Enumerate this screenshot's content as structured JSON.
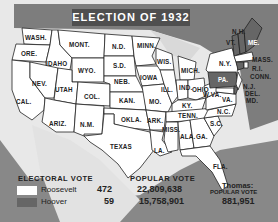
{
  "title": "ELECTION OF 1932",
  "colors": {
    "roosevelt": "#ffffff",
    "hoover": "#666666",
    "water": "#7d7d7d",
    "background": "#e8e8e8"
  },
  "states": [
    {
      "abbr": "WASH.",
      "winner": "Roosevelt"
    },
    {
      "abbr": "ORE.",
      "winner": "Roosevelt"
    },
    {
      "abbr": "CAL.",
      "winner": "Roosevelt"
    },
    {
      "abbr": "IDAHO",
      "winner": "Roosevelt"
    },
    {
      "abbr": "NEV.",
      "winner": "Roosevelt"
    },
    {
      "abbr": "MONT.",
      "winner": "Roosevelt"
    },
    {
      "abbr": "WYO.",
      "winner": "Roosevelt"
    },
    {
      "abbr": "UTAH",
      "winner": "Roosevelt"
    },
    {
      "abbr": "COL.",
      "winner": "Roosevelt"
    },
    {
      "abbr": "ARIZ.",
      "winner": "Roosevelt"
    },
    {
      "abbr": "N.M.",
      "winner": "Roosevelt"
    },
    {
      "abbr": "N.D.",
      "winner": "Roosevelt"
    },
    {
      "abbr": "S.D.",
      "winner": "Roosevelt"
    },
    {
      "abbr": "NEB.",
      "winner": "Roosevelt"
    },
    {
      "abbr": "KAN.",
      "winner": "Roosevelt"
    },
    {
      "abbr": "OKLA.",
      "winner": "Roosevelt"
    },
    {
      "abbr": "TEXAS",
      "winner": "Roosevelt"
    },
    {
      "abbr": "MINN.",
      "winner": "Roosevelt"
    },
    {
      "abbr": "IOWA",
      "winner": "Roosevelt"
    },
    {
      "abbr": "MO.",
      "winner": "Roosevelt"
    },
    {
      "abbr": "ARK.",
      "winner": "Roosevelt"
    },
    {
      "abbr": "LA.",
      "winner": "Roosevelt"
    },
    {
      "abbr": "WIS.",
      "winner": "Roosevelt"
    },
    {
      "abbr": "ILL.",
      "winner": "Roosevelt"
    },
    {
      "abbr": "MICH.",
      "winner": "Roosevelt"
    },
    {
      "abbr": "IND.",
      "winner": "Roosevelt"
    },
    {
      "abbr": "OHIO",
      "winner": "Roosevelt"
    },
    {
      "abbr": "KY.",
      "winner": "Roosevelt"
    },
    {
      "abbr": "TENN.",
      "winner": "Roosevelt"
    },
    {
      "abbr": "MISS.",
      "winner": "Roosevelt"
    },
    {
      "abbr": "ALA.",
      "winner": "Roosevelt"
    },
    {
      "abbr": "GA.",
      "winner": "Roosevelt"
    },
    {
      "abbr": "FLA.",
      "winner": "Roosevelt"
    },
    {
      "abbr": "S.C.",
      "winner": "Roosevelt"
    },
    {
      "abbr": "N.C.",
      "winner": "Roosevelt"
    },
    {
      "abbr": "VA.",
      "winner": "Roosevelt"
    },
    {
      "abbr": "W.VA.",
      "winner": "Roosevelt"
    },
    {
      "abbr": "MD.",
      "winner": "Roosevelt"
    },
    {
      "abbr": "DEL.",
      "winner": "Hoover"
    },
    {
      "abbr": "N.J.",
      "winner": "Roosevelt"
    },
    {
      "abbr": "PA.",
      "winner": "Hoover"
    },
    {
      "abbr": "N.Y.",
      "winner": "Roosevelt"
    },
    {
      "abbr": "CONN.",
      "winner": "Hoover"
    },
    {
      "abbr": "R.I.",
      "winner": "Roosevelt"
    },
    {
      "abbr": "MASS.",
      "winner": "Roosevelt"
    },
    {
      "abbr": "VT.",
      "winner": "Hoover"
    },
    {
      "abbr": "N.H.",
      "winner": "Hoover"
    },
    {
      "abbr": "ME.",
      "winner": "Hoover"
    }
  ],
  "legend": {
    "electoral_header": "ELECTORAL VOTE",
    "popular_header": "POPULAR VOTE",
    "candidates": [
      {
        "name": "Roosevelt",
        "electoral": "472",
        "popular": "22,809,638"
      },
      {
        "name": "Hoover",
        "electoral": "59",
        "popular": "15,758,901"
      }
    ],
    "thomas_label": "Thomas:",
    "thomas_sub": "POPULAR VOTE",
    "thomas_popular": "881,951"
  }
}
